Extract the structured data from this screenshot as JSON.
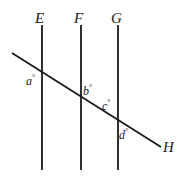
{
  "figure": {
    "type": "geometry-diagram",
    "background_color": "#ffffff",
    "stroke_color": "#1a1a1a",
    "line_labels": [
      {
        "id": "E",
        "text": "E"
      },
      {
        "id": "F",
        "text": "F"
      },
      {
        "id": "G",
        "text": "G"
      },
      {
        "id": "H",
        "text": "H"
      }
    ],
    "angle_labels": [
      {
        "id": "a",
        "symbol": "a",
        "degree": "°"
      },
      {
        "id": "b",
        "symbol": "b",
        "degree": "°"
      },
      {
        "id": "c",
        "symbol": "c",
        "degree": "°"
      },
      {
        "id": "d",
        "symbol": "d",
        "degree": "°"
      }
    ]
  }
}
